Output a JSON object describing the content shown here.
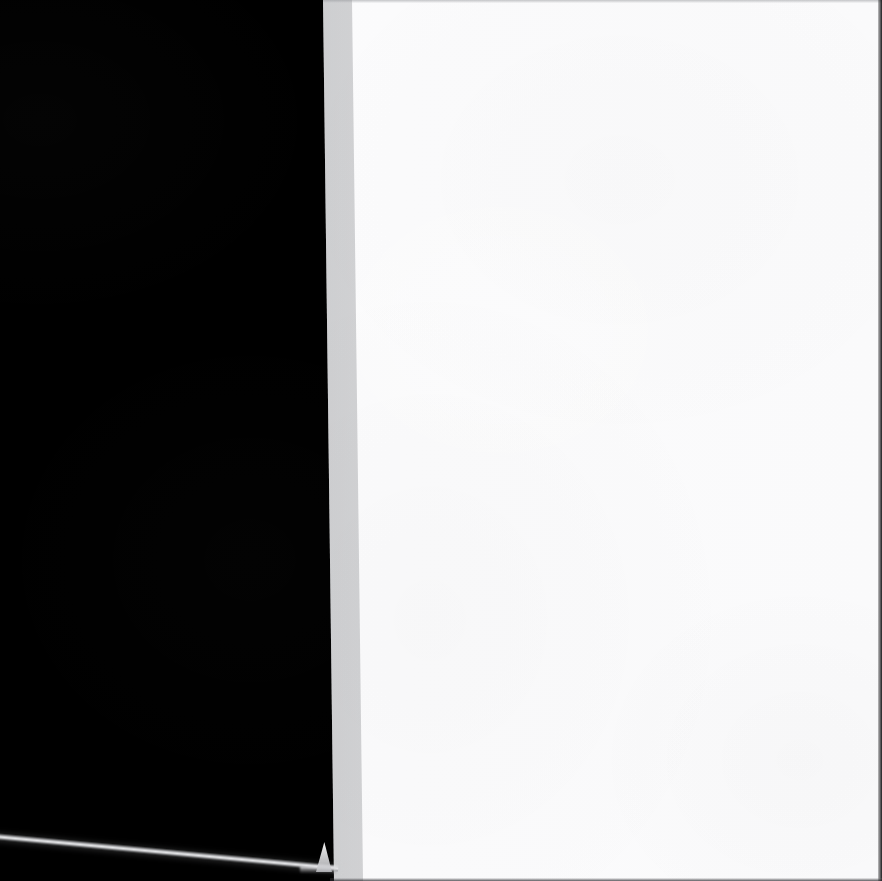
{
  "scene": {
    "width": 882,
    "height": 881,
    "description": "Photographic capture of a blank white page edge against a black background",
    "caption": ""
  },
  "regions": {
    "dark_field": {
      "label": "",
      "color": "#000000",
      "x": 0,
      "y": 0,
      "width": 334,
      "height": 881
    },
    "page": {
      "label": "",
      "color": "#fbfbfc",
      "edge_color": "#e9eaec",
      "top_edge_x": 323,
      "bottom_edge_x": 334,
      "width": 559,
      "height": 881
    }
  },
  "features": {
    "edge_highlight": {
      "label": "",
      "color": "#ecedef",
      "start_y": 836,
      "end_y": 866,
      "thickness": 6
    },
    "corner_spike": {
      "label": "",
      "color": "#ffffff",
      "apex_x": 324,
      "apex_y": 843,
      "base_y": 872
    },
    "right_edge": {
      "label": "",
      "color": "#0a0a0c",
      "width": 4
    },
    "bottom_edge": {
      "label": "",
      "color": "#28282c",
      "height": 3
    },
    "top_rule": {
      "label": "",
      "color": "#96989c",
      "height": 3
    }
  }
}
